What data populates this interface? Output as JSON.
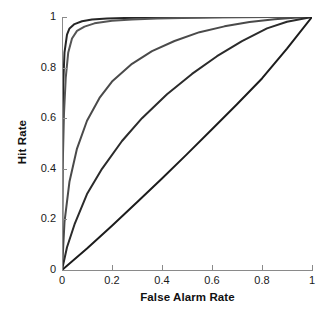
{
  "chart_data": {
    "type": "line",
    "title": "",
    "xlabel": "False Alarm Rate",
    "ylabel": "Hit Rate",
    "xlim": [
      0,
      1
    ],
    "ylim": [
      0,
      1
    ],
    "xticks": [
      "0",
      "0.2",
      "0.4",
      "0.6",
      "0.8",
      "1"
    ],
    "xtick_values": [
      0,
      0.2,
      0.4,
      0.6,
      0.8,
      1
    ],
    "yticks": [
      "0",
      "0.2",
      "0.4",
      "0.6",
      "0.8",
      "1"
    ],
    "ytick_values": [
      0,
      0.2,
      0.4,
      0.6,
      0.8,
      1
    ],
    "grid": false,
    "legend": "none",
    "series": [
      {
        "name": "roc-curve-highest-sensitivity",
        "color": "#262626",
        "linewidth": 2.0,
        "x": [
          0,
          0.002,
          0.005,
          0.01,
          0.02,
          0.03,
          0.05,
          0.08,
          0.12,
          0.18,
          0.25,
          0.35,
          0.45,
          0.55,
          0.65,
          0.75,
          0.85,
          0.92,
          1
        ],
        "y": [
          0,
          0.55,
          0.74,
          0.86,
          0.93,
          0.955,
          0.972,
          0.983,
          0.99,
          0.994,
          0.996,
          0.998,
          0.999,
          0.999,
          1,
          1,
          1,
          1,
          1
        ]
      },
      {
        "name": "roc-curve-high-sensitivity",
        "color": "#555555",
        "linewidth": 2.0,
        "x": [
          0,
          0.003,
          0.008,
          0.015,
          0.025,
          0.04,
          0.06,
          0.09,
          0.13,
          0.2,
          0.28,
          0.38,
          0.48,
          0.6,
          0.72,
          0.84,
          0.93,
          1
        ],
        "y": [
          0,
          0.42,
          0.62,
          0.76,
          0.86,
          0.915,
          0.945,
          0.962,
          0.975,
          0.985,
          0.99,
          0.994,
          0.996,
          0.998,
          0.999,
          1,
          1,
          1
        ]
      },
      {
        "name": "roc-curve-medium-sensitivity",
        "color": "#4a4a4a",
        "linewidth": 2.0,
        "x": [
          0,
          0.01,
          0.03,
          0.06,
          0.1,
          0.15,
          0.2,
          0.28,
          0.36,
          0.45,
          0.55,
          0.65,
          0.75,
          0.85,
          0.93,
          1
        ],
        "y": [
          0,
          0.19,
          0.35,
          0.48,
          0.59,
          0.68,
          0.745,
          0.815,
          0.865,
          0.905,
          0.94,
          0.963,
          0.98,
          0.991,
          0.997,
          1
        ]
      },
      {
        "name": "roc-curve-low-sensitivity",
        "color": "#2b2b2b",
        "linewidth": 2.0,
        "x": [
          0,
          0.02,
          0.05,
          0.1,
          0.16,
          0.24,
          0.32,
          0.42,
          0.52,
          0.62,
          0.72,
          0.82,
          0.9,
          1
        ],
        "y": [
          0,
          0.09,
          0.18,
          0.3,
          0.4,
          0.51,
          0.6,
          0.695,
          0.775,
          0.845,
          0.905,
          0.955,
          0.981,
          1
        ]
      },
      {
        "name": "roc-curve-chance-diagonal",
        "color": "#1c1c1c",
        "linewidth": 2.0,
        "x": [
          0,
          0.1,
          0.2,
          0.3,
          0.4,
          0.5,
          0.6,
          0.7,
          0.8,
          0.9,
          1
        ],
        "y": [
          0,
          0.085,
          0.175,
          0.268,
          0.362,
          0.458,
          0.556,
          0.655,
          0.757,
          0.875,
          1
        ]
      }
    ]
  },
  "axes": {
    "x_title": "False Alarm Rate",
    "y_title": "Hit Rate"
  }
}
